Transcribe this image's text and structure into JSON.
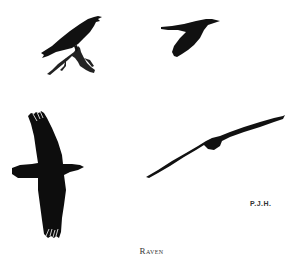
{
  "plate": {
    "caption": "Raven",
    "signature": "P.J.H.",
    "ink_color": "#111111",
    "background": "#ffffff"
  },
  "figures": [
    {
      "id": "perched-raven",
      "pose": "perched on branch, facing right, beak open"
    },
    {
      "id": "flying-raven-side",
      "pose": "in flight, side view, facing right"
    },
    {
      "id": "soaring-raven-below",
      "pose": "soaring, viewed from below, wings spread"
    },
    {
      "id": "gliding-raven-front",
      "pose": "gliding, head-on view, wings outstretched"
    }
  ]
}
